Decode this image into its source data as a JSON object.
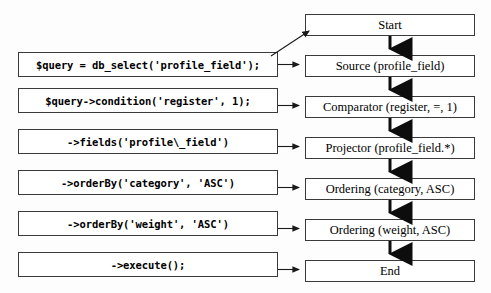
{
  "diagram": {
    "type": "flowchart",
    "orientation": "two-column",
    "colors": {
      "background": "#fdfdfd",
      "box_fill": "#ffffff",
      "box_border": "#3a3a3a",
      "arrow": "#1a1a1a",
      "text": "#000000"
    },
    "code_column": {
      "label": "PHP query builder calls",
      "items": [
        {
          "id": "code-db-select",
          "text": "$query = db_select('profile_field');"
        },
        {
          "id": "code-condition",
          "text": "$query->condition('register', 1);"
        },
        {
          "id": "code-fields",
          "text": "->fields('profile\\_field')"
        },
        {
          "id": "code-orderby-category",
          "text": "->orderBy('category', 'ASC')"
        },
        {
          "id": "code-orderby-weight",
          "text": "->orderBy('weight', 'ASC')"
        },
        {
          "id": "code-execute",
          "text": "->execute();"
        }
      ]
    },
    "stage_column": {
      "label": "Query execution stages",
      "items": [
        {
          "id": "stage-start",
          "text": "Start"
        },
        {
          "id": "stage-source",
          "text": "Source (profile_field)"
        },
        {
          "id": "stage-comparator",
          "text": "Comparator (register, =, 1)"
        },
        {
          "id": "stage-projector",
          "text": "Projector (profile_field.*)"
        },
        {
          "id": "stage-ordering-category",
          "text": "Ordering (category, ASC)"
        },
        {
          "id": "stage-ordering-weight",
          "text": "Ordering (weight, ASC)"
        },
        {
          "id": "stage-end",
          "text": "End"
        }
      ]
    },
    "connectors": {
      "diagonal_label": "db_select call creates the Start node",
      "horizontal_label": "maps to stage",
      "vertical_label": "next stage"
    }
  }
}
